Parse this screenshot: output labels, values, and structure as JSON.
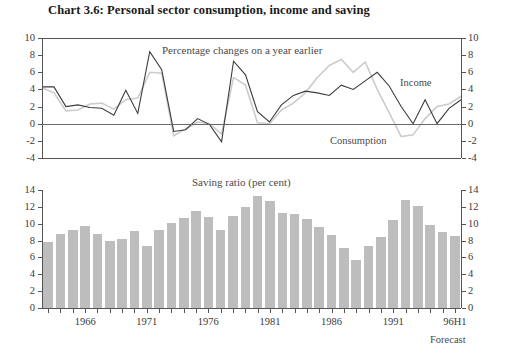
{
  "title": "Chart 3.6: Personal sector consumption, income and saving",
  "forecast_label": "Forecast",
  "colors": {
    "income_line": "#3c3c3c",
    "consumption_line": "#cccccc",
    "bar_fill": "#bdbdbd",
    "axis": "#555555",
    "text": "#2b2b2b"
  },
  "chart_data": [
    {
      "type": "line",
      "title": "",
      "subtitle": "Percentage changes on a year earlier",
      "xlabel": "",
      "ylabel": "",
      "ylim": [
        -4,
        10
      ],
      "yticks": [
        -4,
        -2,
        0,
        2,
        4,
        6,
        8,
        10
      ],
      "grid": false,
      "zero_line": true,
      "legend": [
        "Income",
        "Consumption"
      ],
      "legend_position": "inline-annotation",
      "x": [
        1963,
        1964,
        1965,
        1966,
        1967,
        1968,
        1969,
        1970,
        1971,
        1972,
        1973,
        1974,
        1975,
        1976,
        1977,
        1978,
        1979,
        1980,
        1981,
        1982,
        1983,
        1984,
        1985,
        1986,
        1987,
        1988,
        1989,
        1990,
        1991,
        1992,
        1993,
        1994,
        1995,
        1996
      ],
      "series": [
        {
          "name": "Income",
          "values": [
            4.3,
            4.3,
            2.0,
            2.2,
            1.9,
            1.8,
            1.0,
            3.9,
            1.2,
            8.4,
            6.3,
            -0.9,
            -0.7,
            0.6,
            -0.1,
            -2.1,
            7.3,
            5.7,
            1.4,
            0.2,
            2.2,
            3.3,
            3.8,
            3.6,
            3.3,
            4.5,
            4.0,
            5.0,
            6.0,
            4.4,
            2.0,
            0.0,
            2.8,
            0.0,
            1.8,
            2.8
          ]
        },
        {
          "name": "Consumption",
          "values": [
            4.2,
            3.6,
            1.5,
            1.6,
            2.3,
            2.4,
            1.7,
            2.8,
            3.0,
            6.0,
            5.9,
            -1.4,
            -0.6,
            0.2,
            0.0,
            -1.2,
            5.4,
            4.5,
            0.1,
            0.0,
            1.6,
            2.4,
            3.6,
            5.4,
            6.8,
            7.5,
            6.0,
            7.2,
            4.0,
            1.3,
            -1.5,
            -1.3,
            0.6,
            2.0,
            2.3,
            3.2
          ]
        }
      ]
    },
    {
      "type": "bar",
      "title": "Saving ratio (per cent)",
      "xlabel": "",
      "ylabel": "",
      "ylim": [
        0,
        14
      ],
      "yticks": [
        0,
        2,
        4,
        6,
        8,
        10,
        12,
        14
      ],
      "grid": false,
      "categories": [
        "1963",
        "1964",
        "1965",
        "1966",
        "1967",
        "1968",
        "1969",
        "1970",
        "1971",
        "1972",
        "1973",
        "1974",
        "1975",
        "1976",
        "1977",
        "1978",
        "1979",
        "1980",
        "1981",
        "1982",
        "1983",
        "1984",
        "1985",
        "1986",
        "1987",
        "1988",
        "1989",
        "1990",
        "1991",
        "1992",
        "1993",
        "1994",
        "1995",
        "96H1"
      ],
      "values": [
        7.8,
        8.8,
        9.3,
        9.7,
        8.8,
        7.9,
        8.2,
        9.1,
        7.3,
        9.2,
        10.1,
        10.7,
        11.5,
        10.8,
        9.2,
        10.9,
        12.0,
        13.3,
        12.7,
        11.3,
        11.1,
        10.6,
        9.6,
        8.7,
        7.1,
        5.7,
        7.3,
        8.4,
        10.5,
        12.8,
        12.1,
        9.9,
        9.0,
        8.6
      ],
      "xtick_labels": [
        "1966",
        "1971",
        "1976",
        "1981",
        "1986",
        "1991",
        "96H1"
      ],
      "xtick_label_years": [
        1966,
        1971,
        1976,
        1981,
        1986,
        1991,
        1996
      ],
      "annotation": "Forecast"
    }
  ]
}
